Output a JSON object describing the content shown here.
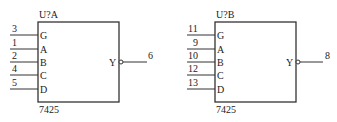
{
  "chips": [
    {
      "ref": "U?A",
      "part": "7425",
      "inputs": [
        {
          "pin_name": "G",
          "pin_number": "3"
        },
        {
          "pin_name": "A",
          "pin_number": "1"
        },
        {
          "pin_name": "B",
          "pin_number": "2"
        },
        {
          "pin_name": "C",
          "pin_number": "4"
        },
        {
          "pin_name": "D",
          "pin_number": "5"
        }
      ],
      "output": {
        "pin_name": "Y",
        "pin_number": "6",
        "inverted": true
      }
    },
    {
      "ref": "U?B",
      "part": "7425",
      "inputs": [
        {
          "pin_name": "G",
          "pin_number": "11"
        },
        {
          "pin_name": "A",
          "pin_number": "9"
        },
        {
          "pin_name": "B",
          "pin_number": "10"
        },
        {
          "pin_name": "C",
          "pin_number": "12"
        },
        {
          "pin_name": "D",
          "pin_number": "13"
        }
      ],
      "output": {
        "pin_name": "Y",
        "pin_number": "8",
        "inverted": true
      }
    }
  ]
}
